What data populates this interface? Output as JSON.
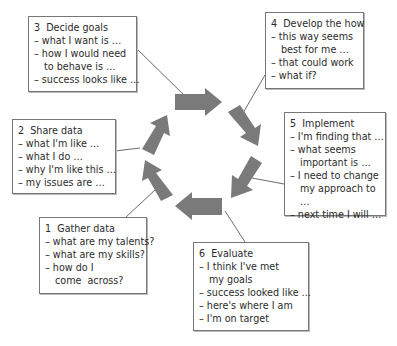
{
  "diagram": {
    "arrow_color": "#7a7a7a",
    "line_color": "#444444",
    "stages": [
      {
        "number": "1",
        "title": "Gather data",
        "items": [
          "what are my talents?",
          "what are my skills?",
          "how do I come  across?"
        ]
      },
      {
        "number": "2",
        "title": "Share data",
        "items": [
          "what I'm like …",
          "what I do …",
          "why I'm like this …",
          "my issues are …"
        ]
      },
      {
        "number": "3",
        "title": "Decide goals",
        "items": [
          "what I want is …",
          "how I would need to behave is …",
          "success looks like …"
        ]
      },
      {
        "number": "4",
        "title": "Develop the how",
        "items": [
          "this way seems best for me …",
          "that could work",
          "what if?"
        ]
      },
      {
        "number": "5",
        "title": "Implement",
        "items": [
          "I'm finding that …",
          "what seems important is …",
          "I need to change my approach to …",
          "next time I will …"
        ]
      },
      {
        "number": "6",
        "title": "Evaluate",
        "items": [
          "I think I've met my goals",
          "success looked like …",
          "here's where I am",
          "I'm on target"
        ]
      }
    ]
  }
}
